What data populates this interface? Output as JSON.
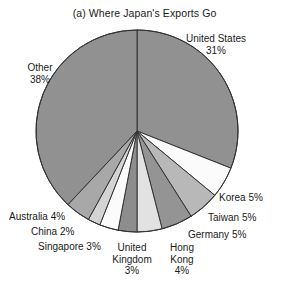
{
  "chart_data": {
    "type": "pie",
    "title": "(a) Where Japan's Exports Go",
    "xlabel": "",
    "ylabel": "",
    "legend": "none",
    "grid": false,
    "units": "percent",
    "start_angle_deg": 0,
    "direction": "clockwise",
    "categories": [
      "United States",
      "Korea",
      "Taiwan",
      "Germany",
      "Hong Kong",
      "United Kingdom",
      "Singapore",
      "China",
      "Australia",
      "Other"
    ],
    "values": [
      31,
      5,
      5,
      5,
      4,
      3,
      3,
      2,
      4,
      38
    ],
    "slices": [
      {
        "label": "United States",
        "value": 31,
        "value_text": "31%",
        "color": "#919191"
      },
      {
        "label": "Korea",
        "value": 5,
        "value_text": "5%",
        "color": "#fbfbfb"
      },
      {
        "label": "Taiwan",
        "value": 5,
        "value_text": "5%",
        "color": "#b8b8b8"
      },
      {
        "label": "Germany",
        "value": 5,
        "value_text": "5%",
        "color": "#949494"
      },
      {
        "label": "Hong Kong",
        "value": 4,
        "value_text": "4%",
        "color": "#e2e2e2"
      },
      {
        "label": "United Kingdom",
        "value": 3,
        "value_text": "3%",
        "color": "#8d8d8d"
      },
      {
        "label": "Singapore",
        "value": 3,
        "value_text": "3%",
        "color": "#fbfbfb"
      },
      {
        "label": "China",
        "value": 2,
        "value_text": "2%",
        "color": "#d4d4d4"
      },
      {
        "label": "Australia",
        "value": 4,
        "value_text": "4%",
        "color": "#a8a8a8"
      },
      {
        "label": "Other",
        "value": 38,
        "value_text": "38%",
        "color": "#919191"
      }
    ],
    "geometry": {
      "cx": 137,
      "cy": 131,
      "r": 101
    },
    "stroke_color": "#333333",
    "background": "#ffffff"
  },
  "labels": {
    "united_states": {
      "line1": "United States",
      "line2": "31%"
    },
    "other": {
      "line1": "Other",
      "line2": "38%"
    },
    "korea": {
      "line1": "Korea 5%"
    },
    "taiwan": {
      "line1": "Taiwan 5%"
    },
    "germany": {
      "line1": "Germany 5%"
    },
    "australia": {
      "line1": "Australia 4%"
    },
    "china": {
      "line1": "China 2%"
    },
    "singapore": {
      "line1": "Singapore 3%"
    },
    "united_kingdom": {
      "line1": "United",
      "line2": "Kingdom",
      "line3": "3%"
    },
    "hong_kong": {
      "line1": "Hong",
      "line2": "Kong",
      "line3": "4%"
    }
  }
}
